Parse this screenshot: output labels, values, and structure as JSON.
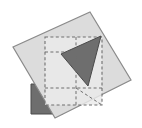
{
  "figure": {
    "canvas": {
      "width": 142,
      "height": 128,
      "background_color": "#ffffff"
    },
    "colors": {
      "light_square_fill": "#dcdcdc",
      "light_square_stroke": "#8a8a8a",
      "overlay_fill": "#eaeaea",
      "dashed_stroke": "#6f6f6f",
      "dark_triangle_fill": "#6e6e6e",
      "dark_triangle_stroke": "#4a4a4a",
      "dark_block_fill": "#6e6e6e",
      "dark_block_stroke": "#4a4a4a"
    },
    "shapes": [
      {
        "name": "dark-block",
        "kind": "polygon",
        "label": "dark gray block (lower left)",
        "fill": "#6e6e6e",
        "stroke": "#4a4a4a",
        "stroke_width": 1,
        "points": [
          [
            31,
            84
          ],
          [
            63,
            84
          ],
          [
            63,
            114
          ],
          [
            31,
            114
          ]
        ]
      },
      {
        "name": "light-rotated-square",
        "kind": "polygon",
        "label": "large rotated light gray square",
        "fill": "#dcdcdc",
        "stroke": "#8a8a8a",
        "stroke_width": 1.2,
        "points": [
          [
            90,
            12
          ],
          [
            131,
            80
          ],
          [
            55,
            118
          ],
          [
            13,
            47
          ]
        ]
      },
      {
        "name": "dashed-square-overlay",
        "kind": "polygon",
        "label": "axis aligned dashed square overlay",
        "fill": "#eaeaea",
        "fill_opacity": 0.82,
        "stroke": "#6f6f6f",
        "stroke_width": 1.1,
        "stroke_dasharray": "3,2.4",
        "points": [
          [
            45,
            37
          ],
          [
            102,
            37
          ],
          [
            102,
            105
          ],
          [
            45,
            105
          ]
        ]
      },
      {
        "name": "dark-triangle",
        "kind": "polygon",
        "label": "dark gray triangle",
        "fill": "#6e6e6e",
        "stroke": "#4a4a4a",
        "stroke_width": 1,
        "points": [
          [
            101,
            36
          ],
          [
            61,
            54
          ],
          [
            88,
            86
          ]
        ]
      },
      {
        "name": "diagonal-guide-lower",
        "kind": "polyline",
        "label": "dashed diagonal guide to bottom corner",
        "stroke": "#6f6f6f",
        "stroke_width": 1,
        "stroke_dasharray": "3,2.4",
        "points": [
          [
            76,
            88
          ],
          [
            102,
            105
          ]
        ]
      },
      {
        "name": "vertical-guide-center",
        "kind": "polyline",
        "label": "dashed vertical centre guide",
        "stroke": "#6f6f6f",
        "stroke_width": 1,
        "stroke_dasharray": "3,2.4",
        "points": [
          [
            76,
            37
          ],
          [
            76,
            105
          ]
        ]
      },
      {
        "name": "horizontal-guide-center",
        "kind": "polyline",
        "label": "dashed horizontal centre guide",
        "stroke": "#6f6f6f",
        "stroke_width": 1,
        "stroke_dasharray": "3,2.4",
        "points": [
          [
            45,
            52
          ],
          [
            76,
            52
          ]
        ]
      },
      {
        "name": "horizontal-guide-lower",
        "kind": "polyline",
        "label": "dashed horizontal lower guide",
        "stroke": "#6f6f6f",
        "stroke_width": 1,
        "stroke_dasharray": "3,2.4",
        "points": [
          [
            45,
            88
          ],
          [
            102,
            88
          ]
        ]
      }
    ]
  }
}
